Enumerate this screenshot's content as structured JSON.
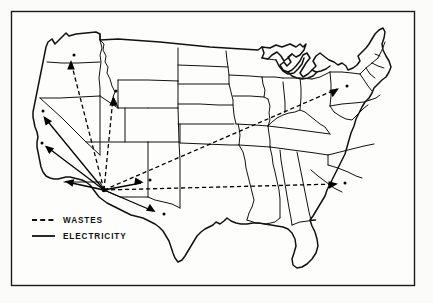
{
  "figure": {
    "background_color": "#fbfbfa",
    "frame_color": "#1a1a1a",
    "line_color": "#111111"
  },
  "legend": {
    "items": [
      {
        "key": "wastes",
        "label": "WASTES",
        "style": "dashed",
        "color": "#111111"
      },
      {
        "key": "electricity",
        "label": "ELECTRICITY",
        "style": "solid",
        "color": "#111111"
      }
    ]
  },
  "map": {
    "region": "Contiguous United States",
    "hub": {
      "name": "origin-hub",
      "label": "",
      "x": 104,
      "y": 190
    },
    "flows": [
      {
        "name": "wastes-to-oregon",
        "type": "wastes",
        "from": [
          104,
          190
        ],
        "to": [
          70,
          60
        ],
        "arrow_angle": -104
      },
      {
        "name": "wastes-to-idaho",
        "type": "wastes",
        "from": [
          104,
          190
        ],
        "to": [
          113,
          96
        ],
        "arrow_angle": -86
      },
      {
        "name": "wastes-to-new-york",
        "type": "wastes",
        "from": [
          104,
          190
        ],
        "to": [
          338,
          89
        ],
        "arrow_angle": -24
      },
      {
        "name": "wastes-to-south-carolina",
        "type": "wastes",
        "from": [
          104,
          190
        ],
        "to": [
          338,
          184
        ],
        "arrow_angle": 2
      },
      {
        "name": "electricity-to-north-california",
        "type": "electricity",
        "from": [
          104,
          190
        ],
        "to": [
          43,
          116
        ],
        "arrow_angle": -130
      },
      {
        "name": "electricity-to-bay-area",
        "type": "electricity",
        "from": [
          104,
          190
        ],
        "to": [
          44,
          146
        ],
        "arrow_angle": -153
      },
      {
        "name": "electricity-to-south-california",
        "type": "electricity",
        "from": [
          104,
          190
        ],
        "to": [
          65,
          182
        ],
        "arrow_angle": -165
      },
      {
        "name": "electricity-to-new-mexico",
        "type": "electricity",
        "from": [
          104,
          190
        ],
        "to": [
          143,
          182
        ],
        "arrow_angle": -11
      },
      {
        "name": "electricity-to-west-texas",
        "type": "electricity",
        "from": [
          104,
          190
        ],
        "to": [
          155,
          213
        ],
        "arrow_angle": 28
      }
    ],
    "endpoint_dots": [
      {
        "name": "dot-oregon",
        "x": 74,
        "y": 55
      },
      {
        "name": "dot-idaho",
        "x": 116,
        "y": 91
      },
      {
        "name": "dot-north-california",
        "x": 43,
        "y": 111
      },
      {
        "name": "dot-bay-area",
        "x": 42,
        "y": 143
      },
      {
        "name": "dot-new-mexico",
        "x": 150,
        "y": 180
      },
      {
        "name": "dot-west-texas",
        "x": 164,
        "y": 214
      },
      {
        "name": "dot-new-york",
        "x": 347,
        "y": 86
      },
      {
        "name": "dot-south-carolina",
        "x": 345,
        "y": 183
      }
    ]
  }
}
